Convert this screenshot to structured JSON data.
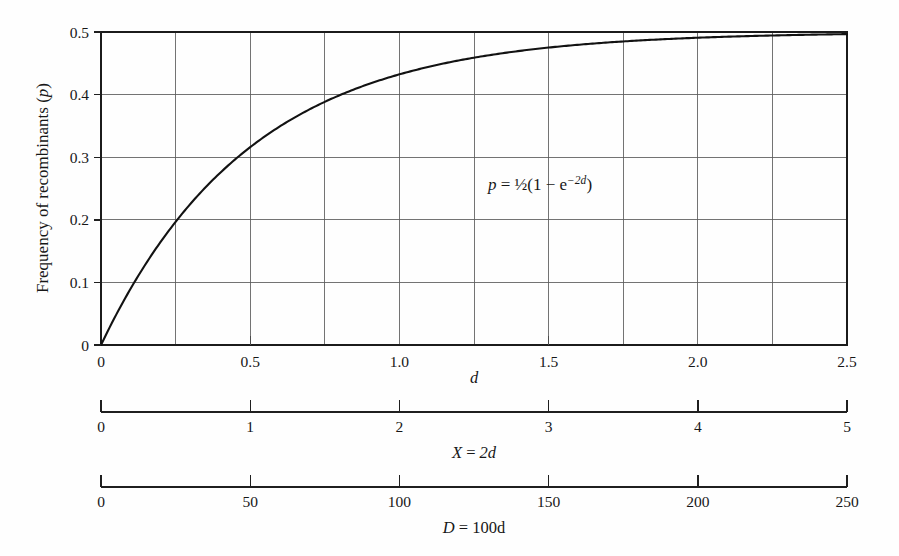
{
  "chart_data": {
    "type": "line",
    "title": "",
    "xlabel": "d",
    "ylabel": "Frequency of recombinants (p)",
    "ylabel_plain": "Frequency of recombinants",
    "ylabel_symbol": "p",
    "xlim": [
      0,
      2.5
    ],
    "ylim": [
      0,
      0.5
    ],
    "grid": true,
    "legend": "none",
    "equation": "p = ½(1 − e⁻²ᵈ)",
    "equation_parts": {
      "lhs": "p",
      "equals": "=",
      "half": "½",
      "open": "(1",
      "minus": "−",
      "base": "e",
      "exponent": "−2d",
      "close": ")"
    },
    "x": [
      0,
      0.125,
      0.25,
      0.375,
      0.5,
      0.625,
      0.75,
      0.875,
      1.0,
      1.125,
      1.25,
      1.375,
      1.5,
      1.625,
      1.75,
      1.875,
      2.0,
      2.125,
      2.25,
      2.375,
      2.5
    ],
    "y": [
      0,
      0.1106,
      0.1967,
      0.2638,
      0.3161,
      0.2,
      0.3884,
      0.4131,
      0.4323,
      0.4473,
      0.4589,
      0.468,
      0.4751,
      0.4806,
      0.4849,
      0.4883,
      0.4908,
      0.4929,
      0.4944,
      0.4957,
      0.4966
    ],
    "series": [
      {
        "name": "p = 1/2 (1 - e^-2d)",
        "x": [
          0,
          0.05,
          0.1,
          0.15,
          0.2,
          0.25,
          0.3,
          0.35,
          0.4,
          0.45,
          0.5,
          0.6,
          0.7,
          0.8,
          0.9,
          1.0,
          1.1,
          1.2,
          1.3,
          1.4,
          1.5,
          1.6,
          1.7,
          1.8,
          1.9,
          2.0,
          2.1,
          2.2,
          2.3,
          2.4,
          2.5
        ],
        "y": [
          0,
          0.0476,
          0.0906,
          0.1296,
          0.1648,
          0.1967,
          0.2256,
          0.2517,
          0.2753,
          0.2967,
          0.3161,
          0.3494,
          0.3767,
          0.3991,
          0.4174,
          0.4323,
          0.4446,
          0.4546,
          0.4629,
          0.4696,
          0.4751,
          0.4796,
          0.4833,
          0.4864,
          0.4888,
          0.4908,
          0.4925,
          0.4939,
          0.495,
          0.4959,
          0.4966
        ]
      }
    ],
    "x_ticks": [
      {
        "value": 0,
        "label": "0"
      },
      {
        "value": 0.5,
        "label": "0.5"
      },
      {
        "value": 1.0,
        "label": "1.0"
      },
      {
        "value": 1.5,
        "label": "1.5"
      },
      {
        "value": 2.0,
        "label": "2.0"
      },
      {
        "value": 2.5,
        "label": "2.5"
      }
    ],
    "y_ticks": [
      {
        "value": 0,
        "label": "0"
      },
      {
        "value": 0.1,
        "label": "0.1"
      },
      {
        "value": 0.2,
        "label": "0.2"
      },
      {
        "value": 0.3,
        "label": "0.3"
      },
      {
        "value": 0.4,
        "label": "0.4"
      },
      {
        "value": 0.5,
        "label": "0.5"
      }
    ],
    "x_gridlines": [
      0,
      0.25,
      0.5,
      0.75,
      1.0,
      1.25,
      1.5,
      1.75,
      2.0,
      2.25,
      2.5
    ],
    "y_gridlines": [
      0,
      0.1,
      0.2,
      0.3,
      0.4,
      0.5
    ],
    "secondary_axes": [
      {
        "id": "axis-x-2d",
        "title": "X = 2d",
        "title_parts": {
          "symbol": "X",
          "equals": "=",
          "expr": "2d"
        },
        "min": 0,
        "max": 5,
        "ticks": [
          {
            "value": 0,
            "label": "0"
          },
          {
            "value": 1,
            "label": "1"
          },
          {
            "value": 2,
            "label": "2"
          },
          {
            "value": 3,
            "label": "3"
          },
          {
            "value": 4,
            "label": "4"
          },
          {
            "value": 5,
            "label": "5"
          }
        ]
      },
      {
        "id": "axis-d-100d",
        "title": "D = 100d",
        "title_parts": {
          "symbol": "D",
          "equals": "=",
          "expr": "100d"
        },
        "min": 0,
        "max": 250,
        "ticks": [
          {
            "value": 0,
            "label": "0"
          },
          {
            "value": 50,
            "label": "50"
          },
          {
            "value": 100,
            "label": "100"
          },
          {
            "value": 150,
            "label": "150"
          },
          {
            "value": 200,
            "label": "200"
          },
          {
            "value": 250,
            "label": "250"
          }
        ]
      }
    ],
    "colors": {
      "curve": "#121212",
      "grid": "#5b5b5b",
      "frame": "#1b1b1b",
      "text": "#171717",
      "background": "#fefefe"
    }
  }
}
